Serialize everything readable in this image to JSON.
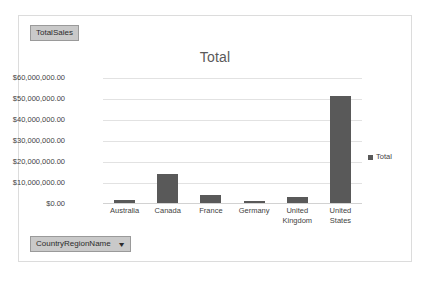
{
  "frame": {
    "background_color": "#ffffff",
    "border_color": "#dcdcdc"
  },
  "field_buttons": {
    "values_label": "TotalSales",
    "axis_label": "CountryRegionName",
    "axis_caret": "▼",
    "button_color": "#c9c9c9"
  },
  "legend": {
    "position": "right",
    "entries": [
      {
        "label": "Total",
        "color": "#595959"
      }
    ]
  },
  "chart_data": {
    "type": "bar",
    "title": "Total",
    "xlabel": "",
    "ylabel": "",
    "categories": [
      "Australia",
      "Canada",
      "France",
      "Germany",
      "United Kingdom",
      "United States"
    ],
    "series": [
      {
        "name": "Total",
        "color": "#595959",
        "values": [
          1500000,
          14000000,
          4000000,
          1000000,
          2800000,
          51500000
        ]
      }
    ],
    "ylim": [
      0,
      60000000
    ],
    "ytick_values": [
      0,
      10000000,
      20000000,
      30000000,
      40000000,
      50000000,
      60000000
    ],
    "ytick_labels": [
      "$0.00",
      "$10,000,000.00",
      "$20,000,000.00",
      "$30,000,000.00",
      "$40,000,000.00",
      "$50,000,000.00",
      "$60,000,000.00"
    ],
    "grid": true,
    "legend_position": "right"
  }
}
